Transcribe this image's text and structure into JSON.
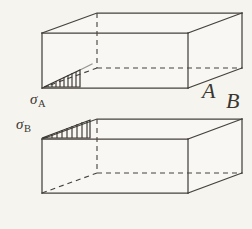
{
  "figure": {
    "background_color": "#f5f4ef",
    "line_color": "#46423c",
    "labels": {
      "box_a_letter": "A",
      "box_b_letter": "B",
      "stress_a_symbol": "σ",
      "stress_a_subscript": "A",
      "stress_b_symbol": "σ",
      "stress_b_subscript": "B"
    },
    "boxes": [
      {
        "name": "box-a",
        "letter": "A",
        "stress_label": "σA",
        "front_face": {
          "top_left": [
            42,
            33
          ],
          "top_right": [
            188,
            33
          ],
          "bottom_right": [
            188,
            88
          ],
          "bottom_left": [
            42,
            88
          ]
        },
        "back_face": {
          "top_left": [
            97,
            13
          ],
          "top_right": [
            242,
            13
          ],
          "bottom_right": [
            242,
            68
          ],
          "bottom_left": [
            97,
            68
          ]
        },
        "hatch": {
          "name": "wedge-a",
          "apex": "right",
          "stroke_count": 9,
          "base_left": [
            44,
            87
          ],
          "base_right": [
            80,
            87
          ],
          "apex_point": [
            80,
            71
          ]
        }
      },
      {
        "name": "box-b",
        "letter": "B",
        "stress_label": "σB",
        "front_face": {
          "top_left": [
            42,
            139
          ],
          "top_right": [
            188,
            139
          ],
          "bottom_right": [
            188,
            193
          ],
          "bottom_left": [
            42,
            193
          ]
        },
        "back_face": {
          "top_left": [
            97,
            119
          ],
          "top_right": [
            242,
            119
          ],
          "bottom_right": [
            242,
            173
          ],
          "bottom_left": [
            97,
            173
          ]
        },
        "hatch": {
          "name": "wedge-b",
          "apex": "left",
          "stroke_count": 9,
          "base_left": [
            43,
            138
          ],
          "base_right": [
            90,
            138
          ],
          "apex_point": [
            43,
            130
          ]
        }
      }
    ]
  }
}
